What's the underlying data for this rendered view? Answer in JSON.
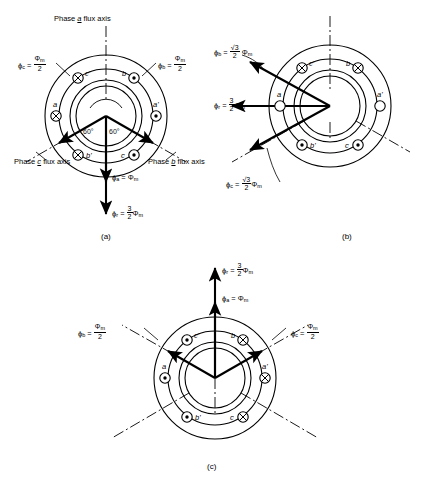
{
  "figure": {
    "captions": [
      {
        "id": "a",
        "text": "(a)"
      },
      {
        "id": "b",
        "text": "(b)"
      },
      {
        "id": "c",
        "text": "(c)"
      }
    ]
  },
  "symbols": {
    "phi": "ϕ",
    "Phi": "Φ",
    "cross": "⊕",
    "dot": "⊙",
    "empty": "○",
    "radical3": "√3",
    "degree": "°"
  },
  "panel_a": {
    "caption": "(a)",
    "axis_labels": [
      {
        "name": "phase-a-axis-label",
        "line1": "Phase",
        "em": "a",
        "line2": "flux axis",
        "text": "Phase a flux axis"
      },
      {
        "name": "phase-c-axis-label",
        "line1": "Phase",
        "em": "c",
        "line2": "flux axis",
        "text": "Phase c flux axis"
      },
      {
        "name": "phase-b-axis-label",
        "line1": "Phase",
        "em": "b",
        "line2": "flux axis",
        "text": "Phase b flux axis"
      }
    ],
    "flux_labels": [
      {
        "name": "phi-c-label",
        "sym": "ϕ",
        "sub": "c",
        "eq": "=",
        "num": "Φ",
        "numsub": "m",
        "den": "2",
        "text": "ϕc = Φm/2"
      },
      {
        "name": "phi-b-label",
        "sym": "ϕ",
        "sub": "b",
        "eq": "=",
        "num": "Φ",
        "numsub": "m",
        "den": "2",
        "text": "ϕb = Φm/2"
      },
      {
        "name": "phi-a-label",
        "sym": "ϕ",
        "sub": "a",
        "eq": "=",
        "value": "Φ",
        "valsub": "m",
        "text": "ϕa = Φm"
      },
      {
        "name": "phi-r-label",
        "sym": "ϕ",
        "sub": "r",
        "eq": "=",
        "num": "3",
        "den": "2",
        "value": "Φ",
        "valsub": "m",
        "text": "ϕr = 3/2 Φm"
      }
    ],
    "angles": [
      "60°",
      "60°"
    ],
    "coils": [
      {
        "name": "coil-c-prime",
        "label": "c'",
        "marker": "cross",
        "pos": "upper-left"
      },
      {
        "name": "coil-b",
        "label": "b",
        "marker": "dot",
        "pos": "upper-right"
      },
      {
        "name": "coil-a",
        "label": "a",
        "marker": "cross",
        "pos": "left"
      },
      {
        "name": "coil-a-prime",
        "label": "a'",
        "marker": "dot",
        "pos": "right"
      },
      {
        "name": "coil-b-prime",
        "label": "b'",
        "marker": "cross",
        "pos": "lower-left"
      },
      {
        "name": "coil-c",
        "label": "c",
        "marker": "dot",
        "pos": "lower-right"
      }
    ]
  },
  "panel_b": {
    "caption": "(b)",
    "flux_labels": [
      {
        "name": "phi-b-label",
        "sym": "ϕ",
        "sub": "b",
        "eq": "=",
        "numrad": "√3",
        "den": "2",
        "value": "Φ",
        "valsub": "m",
        "text": "ϕb = (√3/2)Φm"
      },
      {
        "name": "phi-r-label",
        "sym": "ϕ",
        "sub": "r",
        "eq": "=",
        "num": "3",
        "den": "2",
        "value": "Φ",
        "valsub": "m",
        "text": "ϕr = 3/2 Φm"
      },
      {
        "name": "phi-c-label",
        "sym": "ϕ",
        "sub": "c",
        "eq": "=",
        "numrad": "√3",
        "den": "2",
        "value": "Φ",
        "valsub": "m",
        "text": "ϕc = (√3/2)Φm"
      }
    ],
    "coils": [
      {
        "name": "coil-c-prime",
        "label": "c'",
        "marker": "cross",
        "pos": "upper-left"
      },
      {
        "name": "coil-b",
        "label": "b",
        "marker": "cross",
        "pos": "upper-right"
      },
      {
        "name": "coil-a",
        "label": "a",
        "marker": "empty",
        "pos": "left"
      },
      {
        "name": "coil-a-prime",
        "label": "a'",
        "marker": "empty",
        "pos": "right"
      },
      {
        "name": "coil-b-prime",
        "label": "b'",
        "marker": "dot",
        "pos": "lower-left"
      },
      {
        "name": "coil-c",
        "label": "c",
        "marker": "dot",
        "pos": "lower-right"
      }
    ]
  },
  "panel_c": {
    "caption": "(c)",
    "flux_labels": [
      {
        "name": "phi-r-label",
        "sym": "ϕ",
        "sub": "r",
        "eq": "=",
        "num": "3",
        "den": "2",
        "value": "Φ",
        "valsub": "m",
        "text": "ϕr = 3/2 Φm"
      },
      {
        "name": "phi-a-label",
        "sym": "ϕ",
        "sub": "a",
        "eq": "=",
        "value": "Φ",
        "valsub": "m",
        "text": "ϕa = Φm"
      },
      {
        "name": "phi-b-label",
        "sym": "ϕ",
        "sub": "b",
        "eq": "=",
        "num": "Φ",
        "numsub": "m",
        "den": "2",
        "text": "ϕb = Φm/2"
      },
      {
        "name": "phi-c-label",
        "sym": "ϕ",
        "sub": "c",
        "eq": "=",
        "num": "Φ",
        "numsub": "m",
        "den": "2",
        "text": "ϕc = Φm/2"
      }
    ],
    "coils": [
      {
        "name": "coil-c-prime",
        "label": "c'",
        "marker": "dot",
        "pos": "upper-left"
      },
      {
        "name": "coil-b",
        "label": "b",
        "marker": "cross",
        "pos": "upper-right"
      },
      {
        "name": "coil-a",
        "label": "a",
        "marker": "dot",
        "pos": "left"
      },
      {
        "name": "coil-a-prime",
        "label": "a'",
        "marker": "cross",
        "pos": "right"
      },
      {
        "name": "coil-b-prime",
        "label": "b'",
        "marker": "dot",
        "pos": "lower-left"
      },
      {
        "name": "coil-c",
        "label": "c",
        "marker": "cross",
        "pos": "lower-right"
      }
    ]
  },
  "colors": {
    "line": "#000000",
    "background": "#ffffff"
  }
}
